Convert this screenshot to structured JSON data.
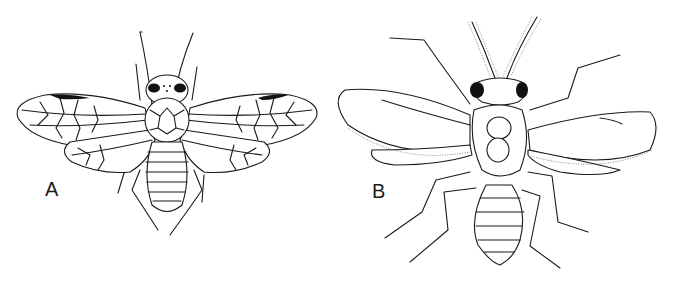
{
  "figure": {
    "panels": [
      {
        "label": "A",
        "subject": "winged insect with reticulate wing venation, dorsal view"
      },
      {
        "label": "B",
        "subject": "winged insect with plumose antennae and fringed wings, dorsal view"
      }
    ],
    "colors": {
      "ink": "#1a1a1a",
      "background": "#ffffff"
    }
  }
}
